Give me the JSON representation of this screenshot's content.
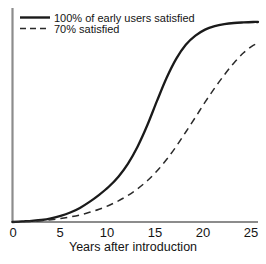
{
  "chart_data": {
    "type": "line",
    "title": "",
    "subtitle": "",
    "xlabel": "Years after introduction",
    "ylabel": "",
    "xlim": [
      0,
      25.5
    ],
    "ylim": [
      0,
      1.05
    ],
    "xticks": [
      "0",
      "5",
      "10",
      "15",
      "20",
      "25"
    ],
    "xtick_values": [
      0,
      5,
      10,
      15,
      20,
      25
    ],
    "yticks": [],
    "grid": false,
    "legend_position": "top-left",
    "series": [
      {
        "name": "100% of early users satisfied",
        "style": "solid",
        "color": "#1a1a1a",
        "x": [
          0,
          1,
          2,
          3,
          4,
          5,
          6,
          7,
          8,
          9,
          10,
          11,
          12,
          13,
          14,
          15,
          16,
          17,
          18,
          19,
          20,
          21,
          22,
          23,
          24,
          25,
          25.5
        ],
        "values": [
          0.0,
          0.003,
          0.006,
          0.01,
          0.018,
          0.03,
          0.047,
          0.07,
          0.1,
          0.135,
          0.175,
          0.225,
          0.29,
          0.375,
          0.48,
          0.6,
          0.715,
          0.81,
          0.88,
          0.925,
          0.955,
          0.972,
          0.982,
          0.988,
          0.991,
          0.993,
          0.993
        ]
      },
      {
        "name": "70% satisfied",
        "style": "dashed",
        "color": "#2a2a2a",
        "x": [
          0,
          1,
          2,
          3,
          4,
          5,
          6,
          7,
          8,
          9,
          10,
          11,
          12,
          13,
          14,
          15,
          16,
          17,
          18,
          19,
          20,
          21,
          22,
          23,
          24,
          25,
          25.5
        ],
        "values": [
          0.0,
          0.002,
          0.004,
          0.007,
          0.011,
          0.017,
          0.025,
          0.035,
          0.048,
          0.063,
          0.082,
          0.105,
          0.132,
          0.165,
          0.205,
          0.253,
          0.31,
          0.375,
          0.447,
          0.52,
          0.595,
          0.665,
          0.73,
          0.79,
          0.84,
          0.877,
          0.885
        ]
      }
    ],
    "annotations": []
  },
  "legend": {
    "entries": [
      {
        "label": "100% of early users satisfied",
        "style": "solid"
      },
      {
        "label": "70% satisfied",
        "style": "dashed"
      }
    ]
  },
  "axes": {
    "x_title": "Years after introduction",
    "tick_labels": [
      "0",
      "5",
      "10",
      "15",
      "20",
      "25"
    ]
  },
  "colors": {
    "line_primary": "#1a1a1a",
    "line_secondary": "#2a2a2a",
    "axis": "#8c8c8c",
    "text": "#141414",
    "background": "#ffffff"
  }
}
